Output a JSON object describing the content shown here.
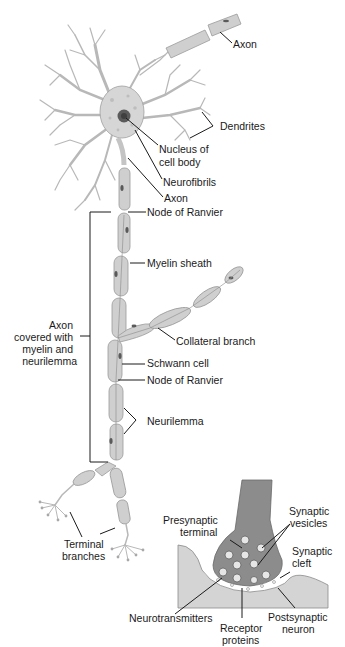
{
  "diagram": {
    "type": "anatomical-illustration",
    "labels": {
      "axon_top": "Axon",
      "dendrites": "Dendrites",
      "nucleus_line1": "Nucleus of",
      "nucleus_line2": "cell body",
      "neurofibrils": "Neurofibrils",
      "axon_hillock": "Axon",
      "node_ranvier_1": "Node of Ranvier",
      "myelin_sheath": "Myelin sheath",
      "axon_covered_line1": "Axon",
      "axon_covered_line2": "covered with",
      "axon_covered_line3": "myelin and",
      "axon_covered_line4": "neurilemma",
      "collateral_branch": "Collateral branch",
      "schwann_cell": "Schwann cell",
      "node_ranvier_2": "Node of Ranvier",
      "neurilemma": "Neurilemma",
      "terminal_line1": "Terminal",
      "terminal_line2": "branches",
      "presynaptic_line1": "Presynaptic",
      "presynaptic_line2": "terminal",
      "vesicles_line1": "Synaptic",
      "vesicles_line2": "vesicles",
      "cleft_line1": "Synaptic",
      "cleft_line2": "cleft",
      "neurotransmitters": "Neurotransmitters",
      "receptor_line1": "Receptor",
      "receptor_line2": "proteins",
      "postsynaptic_line1": "Postsynaptic",
      "postsynaptic_line2": "neuron"
    },
    "colors": {
      "tissue_light": "#cfcfcf",
      "tissue_dark": "#8c8c8c",
      "outline": "#9a9a9a",
      "text": "#1a1a1a"
    }
  }
}
